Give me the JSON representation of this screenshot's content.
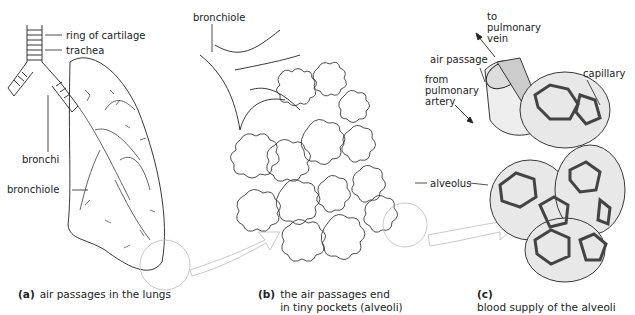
{
  "figure": {
    "panels": [
      {
        "id": "a",
        "caption_letter": "(a)",
        "caption": "air passages in the lungs",
        "labels": [
          "ring of cartilage",
          "trachea",
          "bronchi",
          "bronchiole"
        ]
      },
      {
        "id": "b",
        "caption_letter": "(b)",
        "caption_line1": "the air passages end",
        "caption_line2": "in tiny pockets (alveoli)",
        "labels": [
          "bronchiole",
          "alveolus"
        ]
      },
      {
        "id": "c",
        "caption_letter": "(c)",
        "caption": "blood supply of the alveoli",
        "labels": [
          "to",
          "pulmonary",
          "vein",
          "air passage",
          "from",
          "pulmonary",
          "artery",
          "capillary"
        ]
      }
    ],
    "colors": {
      "ink": "#222222",
      "arrow": "#bbbbbb",
      "capillary": "#555555",
      "tissue": "#e6e6e6"
    }
  }
}
